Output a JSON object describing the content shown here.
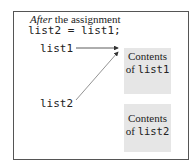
{
  "caption": {
    "italic": "After",
    "rest": " the assignment"
  },
  "code": "list2 = list1;",
  "variables": [
    {
      "name": "list1"
    },
    {
      "name": "list2"
    }
  ],
  "boxes": [
    {
      "label": "Contents",
      "of": "of ",
      "ref": "list1"
    },
    {
      "label": "Contents",
      "of": "of ",
      "ref": "list2"
    }
  ],
  "colors": {
    "box_fill": "#e6e6e6",
    "border": "#555555",
    "arrow": "#333333"
  }
}
